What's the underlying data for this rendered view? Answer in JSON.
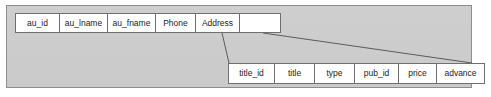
{
  "diagram": {
    "type": "database-table-header-expansion",
    "panel": {
      "background_color": "#c9c9c9",
      "border_color": "#8e8e8e"
    },
    "cell": {
      "background_color": "#ffffff",
      "border_color": "#6f6f6f",
      "text_color": "#1c1c1c"
    },
    "connector": {
      "color": "#5a5a5a",
      "description": "two diagonal lines linking the empty trailing cell of the authors row to the titles row"
    }
  },
  "authors_row": {
    "name": "authors-columns",
    "columns": [
      {
        "label": "au_id"
      },
      {
        "label": "au_lname"
      },
      {
        "label": "au_fname"
      },
      {
        "label": "Phone"
      },
      {
        "label": "Address"
      },
      {
        "label": ""
      }
    ]
  },
  "titles_row": {
    "name": "titles-columns",
    "columns": [
      {
        "label": "title_id"
      },
      {
        "label": "title"
      },
      {
        "label": "type"
      },
      {
        "label": "pub_id"
      },
      {
        "label": "price"
      },
      {
        "label": "advance"
      }
    ]
  }
}
